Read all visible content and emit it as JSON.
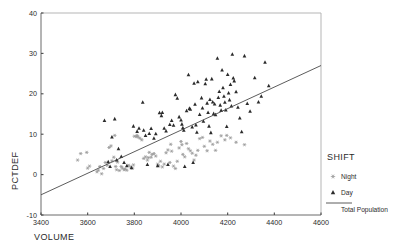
{
  "chart_data": {
    "type": "scatter",
    "title": "",
    "xlabel": "VOLUME",
    "ylabel": "PCTDEF",
    "xlim": [
      3400,
      4600
    ],
    "ylim": [
      -10,
      40
    ],
    "xticks": [
      3400,
      3600,
      3800,
      4000,
      4200,
      4400,
      4600
    ],
    "yticks": [
      -10,
      0,
      10,
      20,
      30,
      40
    ],
    "grid": false,
    "legend": {
      "title": "SHIFT",
      "position": "right",
      "entries": [
        {
          "label": "Night",
          "marker": "asterisk-marker",
          "color": "#9a9a9a"
        },
        {
          "label": "Day",
          "marker": "triangle-marker",
          "color": "#2b2b2b"
        },
        {
          "label": "Total Population",
          "marker": "line-marker",
          "color": "#4a4a4a"
        }
      ]
    },
    "fit_line": {
      "name": "Total Population",
      "x": [
        3400,
        4600
      ],
      "y": [
        -5,
        27
      ],
      "color": "#4a4a4a"
    },
    "series": [
      {
        "name": "Night",
        "marker": "asterisk-marker",
        "color": "#9a9a9a",
        "points": [
          [
            3557,
            3.6
          ],
          [
            3570,
            5.2
          ],
          [
            3596,
            5.5
          ],
          [
            3600,
            1.6
          ],
          [
            3608,
            2.1
          ],
          [
            3640,
            0.7
          ],
          [
            3646,
            1.1
          ],
          [
            3652,
            2.0
          ],
          [
            3660,
            0.2
          ],
          [
            3668,
            1.5
          ],
          [
            3676,
            3.0
          ],
          [
            3684,
            2.3
          ],
          [
            3692,
            6.7
          ],
          [
            3700,
            7.1
          ],
          [
            3704,
            3.4
          ],
          [
            3712,
            4.3
          ],
          [
            3716,
            9.7
          ],
          [
            3720,
            2.0
          ],
          [
            3724,
            1.2
          ],
          [
            3728,
            3.1
          ],
          [
            3736,
            1.0
          ],
          [
            3744,
            2.0
          ],
          [
            3748,
            1.6
          ],
          [
            3756,
            1.2
          ],
          [
            3760,
            1.4
          ],
          [
            3768,
            1.1
          ],
          [
            3776,
            2.3
          ],
          [
            3784,
            1.9
          ],
          [
            3792,
            1.6
          ],
          [
            3796,
            2.4
          ],
          [
            3800,
            9.5
          ],
          [
            3808,
            9.4
          ],
          [
            3812,
            9.7
          ],
          [
            3816,
            9.3
          ],
          [
            3824,
            9.0
          ],
          [
            3832,
            8.6
          ],
          [
            3840,
            4.0
          ],
          [
            3848,
            4.4
          ],
          [
            3856,
            3.6
          ],
          [
            3860,
            4.2
          ],
          [
            3864,
            5.5
          ],
          [
            3872,
            4.3
          ],
          [
            3876,
            5.0
          ],
          [
            3884,
            5.2
          ],
          [
            3892,
            4.6
          ],
          [
            3900,
            2.6
          ],
          [
            3904,
            2.2
          ],
          [
            3912,
            3.3
          ],
          [
            3920,
            1.9
          ],
          [
            3928,
            2.6
          ],
          [
            3936,
            5.4
          ],
          [
            3944,
            6.1
          ],
          [
            3952,
            3.0
          ],
          [
            3956,
            7.5
          ],
          [
            3960,
            5.8
          ],
          [
            3968,
            2.1
          ],
          [
            3976,
            1.5
          ],
          [
            3984,
            3.3
          ],
          [
            3992,
            6.6
          ],
          [
            4000,
            8.2
          ],
          [
            4004,
            7.4
          ],
          [
            4008,
            5.0
          ],
          [
            4016,
            4.4
          ],
          [
            4024,
            7.7
          ],
          [
            4032,
            6.4
          ],
          [
            4040,
            5.9
          ],
          [
            4048,
            5.3
          ],
          [
            4056,
            3.6
          ],
          [
            4064,
            4.8
          ],
          [
            4072,
            6.0
          ],
          [
            4080,
            8.9
          ],
          [
            4092,
            9.2
          ],
          [
            4100,
            7.0
          ],
          [
            4112,
            5.9
          ],
          [
            4124,
            8.3
          ],
          [
            4136,
            7.5
          ],
          [
            4148,
            6.0
          ],
          [
            4156,
            8.0
          ],
          [
            4172,
            9.6
          ],
          [
            4188,
            8.6
          ],
          [
            4196,
            9.7
          ],
          [
            4212,
            9.1
          ],
          [
            4236,
            8.0
          ],
          [
            4272,
            7.4
          ]
        ]
      },
      {
        "name": "Day",
        "marker": "triangle-marker",
        "color": "#2b2b2b",
        "points": [
          [
            3672,
            13.4
          ],
          [
            3688,
            3.2
          ],
          [
            3696,
            2.0
          ],
          [
            3704,
            9.3
          ],
          [
            3716,
            13.8
          ],
          [
            3724,
            3.6
          ],
          [
            3732,
            6.4
          ],
          [
            3744,
            4.5
          ],
          [
            3756,
            3.0
          ],
          [
            3768,
            2.2
          ],
          [
            3788,
            1.7
          ],
          [
            3796,
            12.0
          ],
          [
            3812,
            10.7
          ],
          [
            3820,
            11.5
          ],
          [
            3836,
            17.9
          ],
          [
            3840,
            11.0
          ],
          [
            3848,
            9.7
          ],
          [
            3856,
            2.5
          ],
          [
            3864,
            10.2
          ],
          [
            3872,
            11.4
          ],
          [
            3884,
            9.0
          ],
          [
            3892,
            10.1
          ],
          [
            3900,
            2.2
          ],
          [
            3908,
            15.3
          ],
          [
            3916,
            14.6
          ],
          [
            3920,
            15.4
          ],
          [
            3928,
            11.5
          ],
          [
            3936,
            10.8
          ],
          [
            3944,
            2.5
          ],
          [
            3952,
            12.4
          ],
          [
            3960,
            13.4
          ],
          [
            3968,
            12.2
          ],
          [
            3976,
            19.8
          ],
          [
            3984,
            18.9
          ],
          [
            3992,
            14.3
          ],
          [
            4000,
            13.5
          ],
          [
            4004,
            12.5
          ],
          [
            4008,
            11.6
          ],
          [
            4012,
            11.0
          ],
          [
            4016,
            2.0
          ],
          [
            4024,
            15.8
          ],
          [
            4032,
            24.7
          ],
          [
            4036,
            16.4
          ],
          [
            4040,
            16.2
          ],
          [
            4048,
            11.8
          ],
          [
            4052,
            3.0
          ],
          [
            4056,
            22.6
          ],
          [
            4060,
            17.4
          ],
          [
            4064,
            12.3
          ],
          [
            4068,
            10.5
          ],
          [
            4072,
            23.0
          ],
          [
            4080,
            14.9
          ],
          [
            4088,
            19.0
          ],
          [
            4092,
            16.5
          ],
          [
            4096,
            13.2
          ],
          [
            4104,
            22.5
          ],
          [
            4108,
            23.6
          ],
          [
            4112,
            17.7
          ],
          [
            4116,
            15.4
          ],
          [
            4120,
            12.0
          ],
          [
            4124,
            18.6
          ],
          [
            4128,
            10.4
          ],
          [
            4132,
            23.7
          ],
          [
            4136,
            18.0
          ],
          [
            4140,
            15.1
          ],
          [
            4144,
            17.5
          ],
          [
            4148,
            14.8
          ],
          [
            4156,
            28.8
          ],
          [
            4160,
            19.1
          ],
          [
            4164,
            20.6
          ],
          [
            4168,
            17.2
          ],
          [
            4172,
            15.9
          ],
          [
            4176,
            25.9
          ],
          [
            4180,
            21.5
          ],
          [
            4184,
            19.4
          ],
          [
            4188,
            17.9
          ],
          [
            4192,
            16.0
          ],
          [
            4196,
            11.9
          ],
          [
            4200,
            24.8
          ],
          [
            4204,
            20.2
          ],
          [
            4208,
            18.5
          ],
          [
            4212,
            22.3
          ],
          [
            4216,
            17.0
          ],
          [
            4220,
            29.8
          ],
          [
            4224,
            23.9
          ],
          [
            4228,
            23.2
          ],
          [
            4236,
            20.5
          ],
          [
            4244,
            16.7
          ],
          [
            4252,
            14.0
          ],
          [
            4260,
            10.6
          ],
          [
            4272,
            29.4
          ],
          [
            4284,
            17.6
          ],
          [
            4296,
            15.7
          ],
          [
            4316,
            24.0
          ],
          [
            4332,
            18.0
          ],
          [
            4344,
            19.4
          ],
          [
            4360,
            27.8
          ],
          [
            4376,
            22.0
          ]
        ]
      }
    ]
  }
}
